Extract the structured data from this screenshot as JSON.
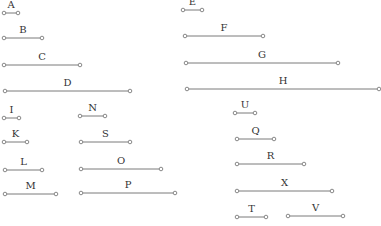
{
  "diagram": {
    "width": 381,
    "height": 226,
    "line_color": "#7a7a7a",
    "label_color": "#333333",
    "endpoint_radius": 1.8,
    "segments": [
      {
        "label": "A",
        "x1": 4,
        "x2": 18,
        "y": 13
      },
      {
        "label": "B",
        "x1": 4,
        "x2": 42,
        "y": 38
      },
      {
        "label": "C",
        "x1": 4,
        "x2": 80,
        "y": 65
      },
      {
        "label": "D",
        "x1": 5,
        "x2": 130,
        "y": 91
      },
      {
        "label": "E",
        "x1": 183,
        "x2": 202,
        "y": 10
      },
      {
        "label": "F",
        "x1": 185,
        "x2": 263,
        "y": 36
      },
      {
        "label": "G",
        "x1": 186,
        "x2": 338,
        "y": 63
      },
      {
        "label": "H",
        "x1": 187,
        "x2": 379,
        "y": 89
      },
      {
        "label": "I",
        "x1": 4,
        "x2": 19,
        "y": 118
      },
      {
        "label": "K",
        "x1": 4,
        "x2": 27,
        "y": 142
      },
      {
        "label": "L",
        "x1": 5,
        "x2": 42,
        "y": 170
      },
      {
        "label": "M",
        "x1": 5,
        "x2": 56,
        "y": 194
      },
      {
        "label": "N",
        "x1": 80,
        "x2": 105,
        "y": 116
      },
      {
        "label": "S",
        "x1": 81,
        "x2": 130,
        "y": 142
      },
      {
        "label": "O",
        "x1": 81,
        "x2": 161,
        "y": 169
      },
      {
        "label": "P",
        "x1": 81,
        "x2": 175,
        "y": 193
      },
      {
        "label": "U",
        "x1": 235,
        "x2": 255,
        "y": 113
      },
      {
        "label": "Q",
        "x1": 237,
        "x2": 274,
        "y": 139
      },
      {
        "label": "R",
        "x1": 237,
        "x2": 304,
        "y": 164
      },
      {
        "label": "X",
        "x1": 237,
        "x2": 332,
        "y": 191
      },
      {
        "label": "T",
        "x1": 237,
        "x2": 266,
        "y": 217
      },
      {
        "label": "V",
        "x1": 288,
        "x2": 343,
        "y": 216
      }
    ]
  }
}
